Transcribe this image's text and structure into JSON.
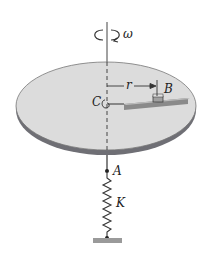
{
  "diagram": {
    "labels": {
      "omega": "ω",
      "center": "C",
      "radius": "r",
      "block": "B",
      "attach_point": "A",
      "spring_constant": "K"
    },
    "colors": {
      "disk_top": "#dcdcdc",
      "disk_rim": "#6f6f75",
      "line": "#333333",
      "ground": "#9a9a9a",
      "slot": "#8a8a8a"
    }
  }
}
